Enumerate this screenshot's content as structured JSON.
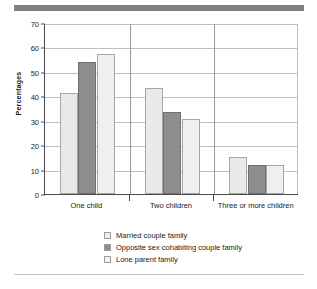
{
  "chart_data": {
    "type": "bar",
    "title": "",
    "subtitle": "",
    "xlabel": "",
    "ylabel": "Percentages",
    "ylim": [
      0,
      70
    ],
    "yticks": [
      0,
      10,
      20,
      30,
      40,
      50,
      60,
      70
    ],
    "grid": "horizontal",
    "legend_position": "bottom",
    "categories": [
      "One child",
      "Two children",
      "Three or more children"
    ],
    "series": [
      {
        "name": "Married couple family",
        "color": "#e9e9e9",
        "values": [
          41.5,
          43.2,
          15.3
        ]
      },
      {
        "name": "Opposite sex cohabiting couple family",
        "color": "#8e8e8e",
        "values": [
          54.2,
          33.5,
          12.0
        ]
      },
      {
        "name": "Lone parent family",
        "color": "#efefef",
        "values": [
          57.4,
          30.7,
          12.0
        ]
      }
    ]
  },
  "figure": {
    "top_rule_color": "#808080",
    "bottom_rule_color": "#c4c4c4",
    "background": "#ffffff"
  }
}
